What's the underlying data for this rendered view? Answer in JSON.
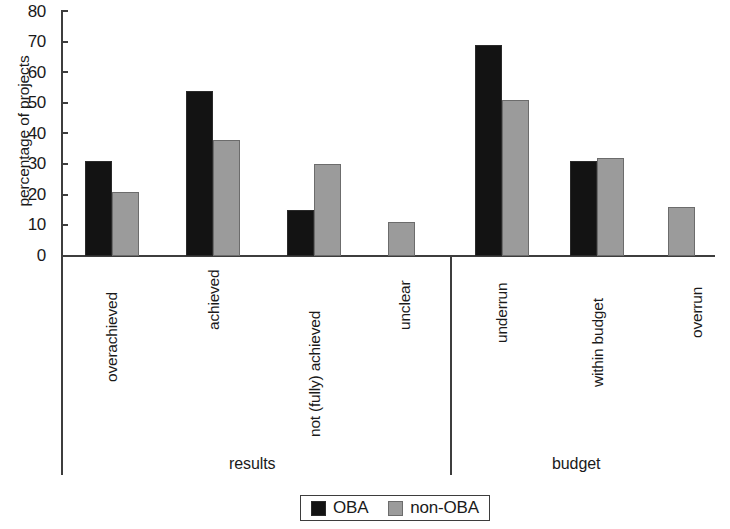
{
  "chart_data": {
    "type": "bar",
    "title": "",
    "xlabel": "",
    "ylabel": "percentage of projects",
    "ylim": [
      0,
      80
    ],
    "yticks": [
      0,
      10,
      20,
      30,
      40,
      50,
      60,
      70,
      80
    ],
    "grid": false,
    "legend_position": "bottom-center",
    "categories": [
      "overachieved",
      "achieved",
      "not (fully) achieved",
      "unclear",
      "underrun",
      "within budget",
      "overrun"
    ],
    "groups": [
      {
        "name": "results",
        "categories": [
          "overachieved",
          "achieved",
          "not (fully) achieved",
          "unclear"
        ]
      },
      {
        "name": "budget",
        "categories": [
          "underrun",
          "within budget",
          "overrun"
        ]
      }
    ],
    "series": [
      {
        "name": "OBA",
        "color": "#131313",
        "values": [
          31,
          54,
          15,
          0,
          69,
          31,
          0
        ]
      },
      {
        "name": "non-OBA",
        "color": "#9b9b9b",
        "values": [
          21,
          38,
          30,
          11,
          51,
          32,
          16
        ]
      }
    ]
  },
  "axis": {
    "y_title": "percentage of projects",
    "y_tick_labels": [
      "80",
      "70",
      "60",
      "50",
      "40",
      "30",
      "20",
      "10",
      "0"
    ]
  },
  "categories": [
    {
      "label": "overachieved"
    },
    {
      "label": "achieved"
    },
    {
      "label": "not (fully) achieved"
    },
    {
      "label": "unclear"
    },
    {
      "label": "underrun"
    },
    {
      "label": "within budget"
    },
    {
      "label": "overrun"
    }
  ],
  "sections": [
    {
      "label": "results"
    },
    {
      "label": "budget"
    }
  ],
  "legend": {
    "entries": [
      {
        "label": "OBA",
        "color": "#131313"
      },
      {
        "label": "non-OBA",
        "color": "#9b9b9b"
      }
    ]
  }
}
